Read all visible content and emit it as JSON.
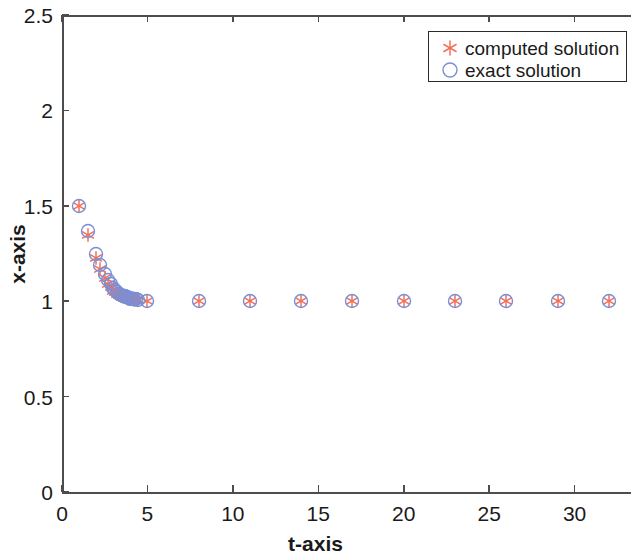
{
  "chart_data": {
    "type": "scatter",
    "title": "",
    "xlabel": "t-axis",
    "ylabel": "x-axis",
    "xlim": [
      0,
      33.3
    ],
    "ylim": [
      0,
      2.5
    ],
    "xticks": [
      0,
      5,
      10,
      15,
      20,
      25,
      30
    ],
    "xtick_labels": [
      "0",
      "5",
      "10",
      "15",
      "20",
      "25",
      "30"
    ],
    "yticks": [
      0,
      0.5,
      1,
      1.5,
      2,
      2.5
    ],
    "ytick_labels": [
      "0",
      "0.5",
      "1",
      "1.5",
      "2",
      "2.5"
    ],
    "grid": false,
    "legend_position": "top-right",
    "legend_entries": [
      {
        "label": "computed solution",
        "marker": "asterisk",
        "color": "#f0705a"
      },
      {
        "label": "exact solution",
        "marker": "circle",
        "color": "#7a8fd6"
      }
    ],
    "series": [
      {
        "name": "computed solution",
        "marker": "asterisk",
        "color": "#f0705a",
        "x": [
          1,
          1.5,
          2,
          2.25,
          2.5,
          2.7,
          2.85,
          3,
          3.12,
          3.24,
          3.36,
          3.47,
          3.58,
          3.68,
          3.78,
          3.88,
          3.97,
          4.06,
          4.15,
          4.24,
          4.33,
          4.42,
          5,
          8,
          11,
          14,
          17,
          20,
          23,
          26,
          29,
          32
        ],
        "y": [
          1.5,
          1.345,
          1.225,
          1.168,
          1.122,
          1.092,
          1.072,
          1.056,
          1.046,
          1.038,
          1.032,
          1.027,
          1.023,
          1.02,
          1.017,
          1.014,
          1.012,
          1.011,
          1.009,
          1.008,
          1.007,
          1.006,
          1.0,
          1.0,
          1.0,
          1.0,
          1.0,
          1.0,
          1.0,
          1.0,
          1.0,
          1.0
        ]
      },
      {
        "name": "exact solution",
        "marker": "circle",
        "color": "#7a8fd6",
        "x": [
          1,
          1.5,
          2,
          2.25,
          2.5,
          2.7,
          2.85,
          3,
          3.12,
          3.24,
          3.36,
          3.47,
          3.58,
          3.68,
          3.78,
          3.88,
          3.97,
          4.06,
          4.15,
          4.24,
          4.33,
          4.42,
          5,
          8,
          11,
          14,
          17,
          20,
          23,
          26,
          29,
          32
        ],
        "y": [
          1.5,
          1.37,
          1.25,
          1.19,
          1.14,
          1.11,
          1.088,
          1.07,
          1.058,
          1.048,
          1.04,
          1.034,
          1.029,
          1.025,
          1.021,
          1.018,
          1.016,
          1.014,
          1.012,
          1.011,
          1.009,
          1.008,
          1.0,
          1.0,
          1.0,
          1.0,
          1.0,
          1.0,
          1.0,
          1.0,
          1.0,
          1.0
        ]
      }
    ]
  },
  "axis_color": "#4d4d4d",
  "text_color": "#1a1a1a"
}
